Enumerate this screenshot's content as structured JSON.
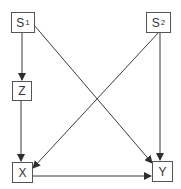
{
  "diagram": {
    "type": "causal-dag",
    "colors": {
      "line": "#3a3a3a",
      "box_border": "#555555",
      "text": "#333333",
      "background": "#ffffff"
    },
    "nodes": [
      {
        "id": "S1",
        "label": "S",
        "subscript": "1",
        "x": 11,
        "y": 12,
        "w": 23,
        "h": 20
      },
      {
        "id": "S2",
        "label": "S",
        "subscript": "2",
        "x": 146,
        "y": 12,
        "w": 25,
        "h": 20
      },
      {
        "id": "Z",
        "label": "Z",
        "subscript": "",
        "x": 12,
        "y": 81,
        "w": 20,
        "h": 20
      },
      {
        "id": "X",
        "label": "X",
        "subscript": "",
        "x": 12,
        "y": 162,
        "w": 21,
        "h": 20
      },
      {
        "id": "Y",
        "label": "Y",
        "subscript": "",
        "x": 152,
        "y": 161,
        "w": 20,
        "h": 21
      }
    ],
    "edges": [
      {
        "from": "S1",
        "to": "Z"
      },
      {
        "from": "S1",
        "to": "Y"
      },
      {
        "from": "S2",
        "to": "X"
      },
      {
        "from": "S2",
        "to": "Y"
      },
      {
        "from": "Z",
        "to": "X"
      },
      {
        "from": "X",
        "to": "Y"
      }
    ]
  }
}
